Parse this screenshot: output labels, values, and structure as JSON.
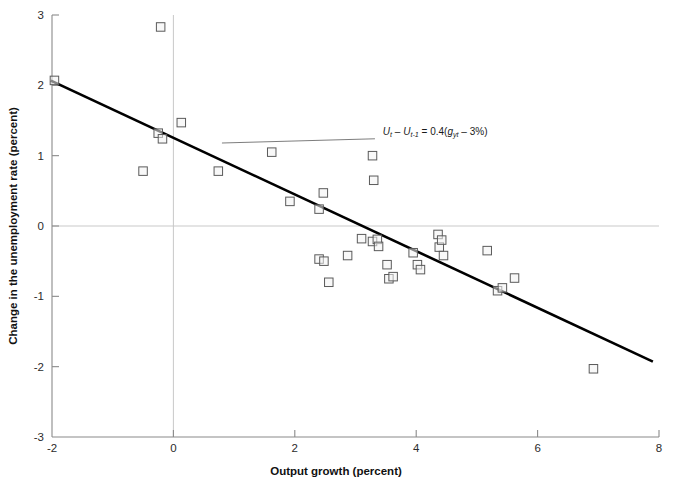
{
  "chart_data": {
    "type": "scatter",
    "title": "",
    "xlabel": "Output growth (percent)",
    "ylabel": "Change in the unemployment rate (percent)",
    "xlim": [
      -2,
      8
    ],
    "ylim": [
      -3,
      3
    ],
    "xticks": [
      -2,
      0,
      2,
      4,
      6,
      8
    ],
    "yticks": [
      -3,
      -2,
      -1,
      0,
      1,
      2,
      3
    ],
    "xticklabels": [
      "-2",
      "0",
      "2",
      "4",
      "6",
      "8"
    ],
    "yticklabels": [
      "-3",
      "-2",
      "-1",
      "0",
      "1",
      "2",
      "3"
    ],
    "grid": false,
    "legend": null,
    "zero_line_y": 0,
    "zero_line_x": 0,
    "marker": "open-square",
    "points": [
      {
        "x": -1.96,
        "y": 2.07
      },
      {
        "x": -0.21,
        "y": 2.83
      },
      {
        "x": -0.5,
        "y": 0.78
      },
      {
        "x": -0.25,
        "y": 1.32
      },
      {
        "x": -0.18,
        "y": 1.24
      },
      {
        "x": 0.13,
        "y": 1.47
      },
      {
        "x": 0.74,
        "y": 0.78
      },
      {
        "x": 1.62,
        "y": 1.05
      },
      {
        "x": 1.92,
        "y": 0.35
      },
      {
        "x": 2.4,
        "y": 0.24
      },
      {
        "x": 2.47,
        "y": 0.47
      },
      {
        "x": 3.28,
        "y": 1.0
      },
      {
        "x": 3.3,
        "y": 0.65
      },
      {
        "x": 2.4,
        "y": -0.47
      },
      {
        "x": 2.48,
        "y": -0.5
      },
      {
        "x": 2.56,
        "y": -0.8
      },
      {
        "x": 2.87,
        "y": -0.42
      },
      {
        "x": 3.1,
        "y": -0.18
      },
      {
        "x": 3.28,
        "y": -0.22
      },
      {
        "x": 3.36,
        "y": -0.19
      },
      {
        "x": 3.38,
        "y": -0.29
      },
      {
        "x": 3.52,
        "y": -0.55
      },
      {
        "x": 3.55,
        "y": -0.75
      },
      {
        "x": 3.62,
        "y": -0.72
      },
      {
        "x": 3.95,
        "y": -0.38
      },
      {
        "x": 4.02,
        "y": -0.55
      },
      {
        "x": 4.07,
        "y": -0.62
      },
      {
        "x": 4.36,
        "y": -0.12
      },
      {
        "x": 4.38,
        "y": -0.3
      },
      {
        "x": 4.42,
        "y": -0.2
      },
      {
        "x": 4.45,
        "y": -0.42
      },
      {
        "x": 5.17,
        "y": -0.35
      },
      {
        "x": 5.34,
        "y": -0.92
      },
      {
        "x": 5.42,
        "y": -0.88
      },
      {
        "x": 5.62,
        "y": -0.74
      },
      {
        "x": 6.92,
        "y": -2.03
      }
    ],
    "fit_line": {
      "label": "Ut - Ut-1 = 0.4(gyt - 3%)",
      "slope": -0.4,
      "intercept": 1.2,
      "x_start": -2.0,
      "y_start": 2.06,
      "x_end": 7.88,
      "y_end": -1.92
    },
    "annotation": {
      "parts": {
        "u": "U",
        "t": "t",
        "minus": " – ",
        "u2": "U",
        "t2": "t-1",
        "eq": " = 0.4(",
        "g": "g",
        "yt": "yt",
        "tail": " – 3%)"
      },
      "plain_text": "Ut – Ut-1 = 0.4(gyt – 3%)",
      "leader_from": {
        "x": 3.32,
        "y": 1.24
      },
      "leader_to": {
        "x": 0.8,
        "y": 1.18
      }
    },
    "colors": {
      "marker_stroke": "#5a5a5a",
      "marker_fill": "#f2f2f2",
      "fit_line": "#000000",
      "axis": "#8a8a8a",
      "zero_line": "#c9c9c9",
      "text": "#1a1a1a"
    }
  },
  "axes": {
    "x_title": "Output growth (percent)",
    "y_title": "Change in the unemployment rate (percent)"
  }
}
